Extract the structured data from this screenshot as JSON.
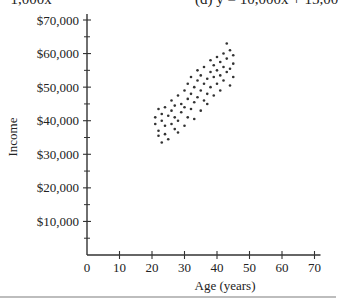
{
  "header": {
    "left_fragment": "−1,000x",
    "right_fragment": "(d) y = 10,000x + 15,00"
  },
  "chart_data": {
    "type": "scatter",
    "title": "",
    "xlabel": "Age (years)",
    "ylabel": "Income",
    "xlim": [
      0,
      70
    ],
    "ylim": [
      0,
      70000
    ],
    "x_ticks": [
      0,
      10,
      20,
      30,
      40,
      50,
      60,
      70
    ],
    "x_tick_labels": [
      "0",
      "10",
      "20",
      "30",
      "40",
      "50",
      "60",
      "70"
    ],
    "y_ticks": [
      10000,
      20000,
      30000,
      40000,
      50000,
      60000,
      70000
    ],
    "y_tick_labels": [
      "$10,000",
      "$20,000",
      "$30,000",
      "$40,000",
      "$50,000",
      "$60,000",
      "$70,000"
    ],
    "y_minor_ticks": [
      5000,
      15000,
      25000,
      35000,
      45000,
      55000,
      65000
    ],
    "grid": false,
    "legend": null,
    "points": [
      [
        21,
        41000
      ],
      [
        21,
        39000
      ],
      [
        22,
        43500
      ],
      [
        22,
        37000
      ],
      [
        22,
        35500
      ],
      [
        23,
        33500
      ],
      [
        23,
        40000
      ],
      [
        23,
        42000
      ],
      [
        24,
        38500
      ],
      [
        24,
        44000
      ],
      [
        24,
        36000
      ],
      [
        25,
        41500
      ],
      [
        25,
        34500
      ],
      [
        26,
        39000
      ],
      [
        26,
        43000
      ],
      [
        26,
        46000
      ],
      [
        27,
        37500
      ],
      [
        27,
        41000
      ],
      [
        27,
        44500
      ],
      [
        28,
        40000
      ],
      [
        28,
        47500
      ],
      [
        28,
        36500
      ],
      [
        29,
        42500
      ],
      [
        29,
        45000
      ],
      [
        30,
        38500
      ],
      [
        30,
        44000
      ],
      [
        30,
        49000
      ],
      [
        31,
        41000
      ],
      [
        31,
        46500
      ],
      [
        31,
        51000
      ],
      [
        32,
        43500
      ],
      [
        32,
        48000
      ],
      [
        32,
        53000
      ],
      [
        33,
        40500
      ],
      [
        33,
        45500
      ],
      [
        33,
        50000
      ],
      [
        34,
        47000
      ],
      [
        34,
        52000
      ],
      [
        34,
        55000
      ],
      [
        35,
        43000
      ],
      [
        35,
        49000
      ],
      [
        35,
        53500
      ],
      [
        36,
        46000
      ],
      [
        36,
        51000
      ],
      [
        36,
        56000
      ],
      [
        37,
        48000
      ],
      [
        37,
        52500
      ],
      [
        37,
        45000
      ],
      [
        38,
        50000
      ],
      [
        38,
        54500
      ],
      [
        38,
        58000
      ],
      [
        39,
        47500
      ],
      [
        39,
        53000
      ],
      [
        39,
        56500
      ],
      [
        40,
        51000
      ],
      [
        40,
        55000
      ],
      [
        40,
        59000
      ],
      [
        41,
        49000
      ],
      [
        41,
        53500
      ],
      [
        41,
        57500
      ],
      [
        42,
        52000
      ],
      [
        42,
        56000
      ],
      [
        42,
        60000
      ],
      [
        43,
        54500
      ],
      [
        43,
        58500
      ],
      [
        43,
        63000
      ],
      [
        44,
        50500
      ],
      [
        44,
        55500
      ],
      [
        44,
        61000
      ],
      [
        45,
        53000
      ],
      [
        45,
        57000
      ],
      [
        45,
        59500
      ]
    ]
  }
}
